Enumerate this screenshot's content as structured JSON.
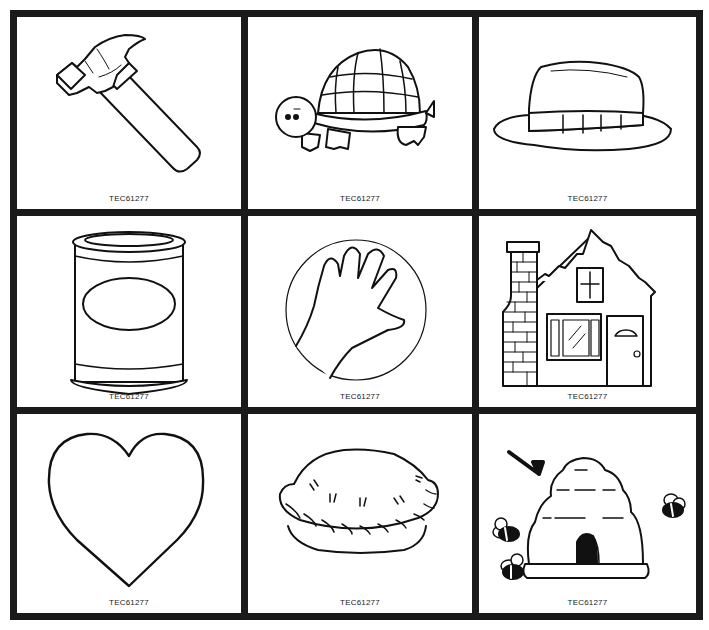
{
  "sheet": {
    "columns": 3,
    "rows": 3,
    "border_color": "#1a1a1a",
    "cards": [
      {
        "id": "hammer",
        "picture": "hammer",
        "code": "TEC61277"
      },
      {
        "id": "turtle",
        "picture": "turtle",
        "code": "TEC61277"
      },
      {
        "id": "hat",
        "picture": "hat",
        "code": "TEC61277"
      },
      {
        "id": "can",
        "picture": "can",
        "code": "TEC61277"
      },
      {
        "id": "hand",
        "picture": "hand",
        "code": "TEC61277"
      },
      {
        "id": "house",
        "picture": "house",
        "code": "TEC61277"
      },
      {
        "id": "heart",
        "picture": "heart",
        "code": "TEC61277"
      },
      {
        "id": "pie",
        "picture": "pie",
        "code": "TEC61277"
      },
      {
        "id": "hive",
        "picture": "beehive",
        "code": "TEC61277"
      }
    ]
  }
}
